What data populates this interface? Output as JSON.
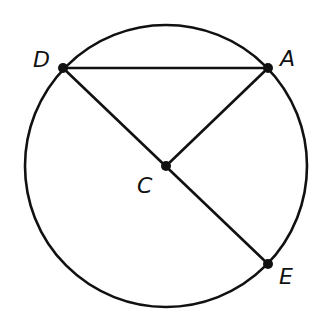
{
  "diagram": {
    "type": "circle-geometry",
    "stroke_color": "#111111",
    "background": "#ffffff",
    "circle": {
      "center": "C",
      "cx": 166,
      "cy": 166,
      "r": 141
    },
    "points": [
      {
        "id": "D",
        "label": "D",
        "x": 63,
        "y": 68,
        "label_x": 33,
        "label_y": 67
      },
      {
        "id": "A",
        "label": "A",
        "x": 268,
        "y": 68,
        "label_x": 280,
        "label_y": 66
      },
      {
        "id": "C",
        "label": "C",
        "x": 166,
        "y": 166,
        "label_x": 137,
        "label_y": 193
      },
      {
        "id": "E",
        "label": "E",
        "x": 268,
        "y": 264,
        "label_x": 279,
        "label_y": 284
      }
    ],
    "segments": [
      {
        "from": "D",
        "to": "A",
        "name": "chord-DA"
      },
      {
        "from": "D",
        "to": "E",
        "name": "diameter-DE"
      },
      {
        "from": "C",
        "to": "A",
        "name": "radius-CA"
      }
    ]
  }
}
